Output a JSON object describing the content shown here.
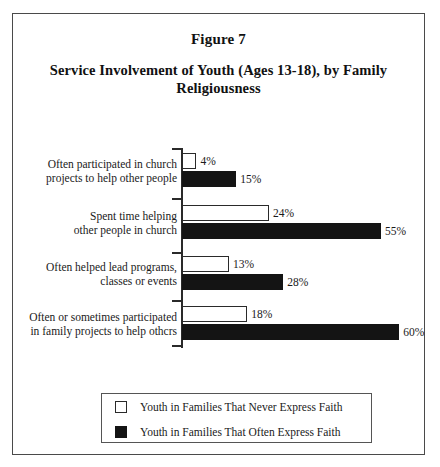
{
  "figure": {
    "number_label": "Figure 7",
    "title": "Service Involvement of Youth (Ages 13-18), by Family Religiousness"
  },
  "chart_data": {
    "type": "bar",
    "orientation": "horizontal",
    "title": "Service Involvement of Youth (Ages 13-18), by Family Religiousness",
    "xlabel": "",
    "ylabel": "",
    "xlim": [
      0,
      65
    ],
    "grid": false,
    "legend_position": "bottom",
    "value_suffix": "%",
    "categories": [
      "Often participated in church projects to help other people",
      "Spent time helping other people in church",
      "Often helped lead programs, classes or events",
      "Often or sometimes participated in family projects to help othcrs"
    ],
    "category_lines": [
      [
        "Often participated in church",
        "projects to help other people"
      ],
      [
        "Spent time helping",
        "other people in church"
      ],
      [
        "Often helped lead programs,",
        "classes or events"
      ],
      [
        "Often or sometimes participated",
        "in family projects to help othcrs"
      ]
    ],
    "series": [
      {
        "name": "Youth in Families That Never Express Faith",
        "color": "#ffffff",
        "values": [
          4,
          24,
          13,
          18
        ],
        "value_labels": [
          "4%",
          "24%",
          "13%",
          "18%"
        ]
      },
      {
        "name": "Youth in Families That Often Express Faith",
        "color": "#141414",
        "values": [
          15,
          55,
          28,
          60
        ],
        "value_labels": [
          "15%",
          "55%",
          "28%",
          "60%"
        ]
      }
    ]
  },
  "legend": {
    "entries": [
      {
        "label": "Youth in Families That Never Express Faith",
        "swatch": "white-square"
      },
      {
        "label": "Youth in Families That Often Express Faith",
        "swatch": "black-square"
      }
    ]
  }
}
